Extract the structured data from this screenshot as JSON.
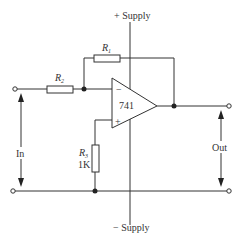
{
  "diagram": {
    "type": "inverting op-amp amplifier",
    "supply_positive_label": "+ Supply",
    "supply_negative_label": "− Supply",
    "opamp": {
      "label": "741",
      "inverting_input": "−",
      "non_inverting_input": "+"
    },
    "resistors": [
      {
        "name": "R",
        "subscript": "1",
        "role": "feedback"
      },
      {
        "name": "R",
        "subscript": "2",
        "role": "input"
      },
      {
        "name": "R",
        "subscript": "3",
        "role": "bias",
        "value": "1K"
      }
    ],
    "input_label": "In",
    "output_label": "Out",
    "colors": {
      "line": "#333333",
      "background": "#ffffff"
    }
  }
}
